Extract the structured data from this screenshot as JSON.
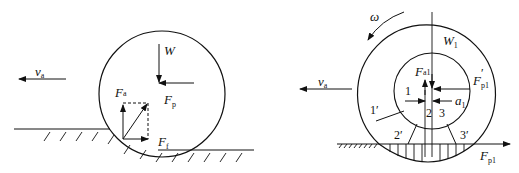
{
  "left_figure": {
    "velocity": {
      "symbol": "v",
      "sub": "a"
    },
    "weight": {
      "symbol": "W"
    },
    "push_force": {
      "symbol": "F",
      "sub": "p"
    },
    "reaction_force": {
      "symbol": "F",
      "sub": "a"
    },
    "friction_force": {
      "symbol": "F",
      "sub": "f"
    }
  },
  "right_figure": {
    "angular_velocity": {
      "symbol": "ω"
    },
    "velocity": {
      "symbol": "v",
      "sub": "a"
    },
    "weight": {
      "symbol": "W",
      "sub": "1"
    },
    "normal_force": {
      "symbol": "F",
      "sub": "a1"
    },
    "push_force_prime": {
      "symbol": "F",
      "sub": "p1",
      "sup": "′"
    },
    "offset": {
      "symbol": "a",
      "sub": "1"
    },
    "ground_force": {
      "symbol": "F",
      "sub": "p1"
    },
    "zone_labels_inner": [
      "1",
      "2",
      "3"
    ],
    "zone_labels_outer": [
      "1′",
      "2′",
      "3′"
    ]
  }
}
